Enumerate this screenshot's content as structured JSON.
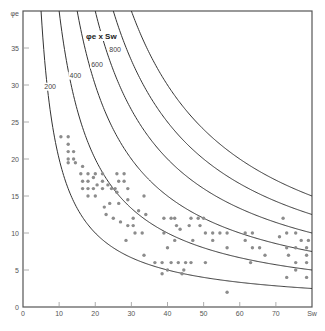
{
  "chart_data": {
    "type": "scatter",
    "title": "",
    "xlabel": "Sw",
    "ylabel": "φe",
    "xlim": [
      0,
      80
    ],
    "ylim": [
      0,
      40
    ],
    "x_ticks": [
      0,
      10,
      20,
      30,
      40,
      50,
      60,
      70
    ],
    "x_tick_labels": [
      "0",
      "10",
      "20",
      "30",
      "40",
      "50",
      "60",
      "70"
    ],
    "y_ticks": [
      0,
      5,
      10,
      15,
      20,
      25,
      30,
      35
    ],
    "y_tick_labels": [
      "0",
      "5",
      "10",
      "15",
      "20",
      "25",
      "30",
      "35"
    ],
    "grid": false,
    "curve_family_label": "φe x Sw",
    "curves": [
      {
        "name": "200",
        "const": 200,
        "label": "200",
        "label_pos": [
          7.5,
          29.5
        ]
      },
      {
        "name": "400",
        "const": 400,
        "label": "400",
        "label_pos": [
          14.5,
          31
        ]
      },
      {
        "name": "600",
        "const": 600,
        "label": "600",
        "label_pos": [
          20.5,
          32.5
        ]
      },
      {
        "name": "800",
        "const": 800,
        "label": "800",
        "label_pos": [
          25.5,
          34.5
        ]
      },
      {
        "name": "1000",
        "const": 1000,
        "label": "",
        "label_pos": null
      },
      {
        "name": "1200",
        "const": 1200,
        "label": "",
        "label_pos": null
      }
    ],
    "points": [
      [
        10.5,
        23
      ],
      [
        12.5,
        23
      ],
      [
        12.5,
        22
      ],
      [
        12.5,
        21
      ],
      [
        14,
        21
      ],
      [
        12.5,
        20
      ],
      [
        14,
        20
      ],
      [
        12.5,
        19.5
      ],
      [
        14.5,
        19.5
      ],
      [
        16.5,
        19
      ],
      [
        16,
        18
      ],
      [
        16.5,
        17
      ],
      [
        18,
        18
      ],
      [
        18,
        17
      ],
      [
        19.5,
        17.5
      ],
      [
        16.5,
        16
      ],
      [
        18,
        16
      ],
      [
        19.5,
        16
      ],
      [
        18,
        15
      ],
      [
        20,
        15
      ],
      [
        20,
        18
      ],
      [
        22,
        18
      ],
      [
        22,
        17
      ],
      [
        22,
        16
      ],
      [
        20.5,
        16.5
      ],
      [
        23.5,
        16.5
      ],
      [
        24.5,
        16
      ],
      [
        25.5,
        16
      ],
      [
        26,
        18
      ],
      [
        28,
        18
      ],
      [
        26.5,
        17
      ],
      [
        28,
        17
      ],
      [
        26.5,
        14
      ],
      [
        29,
        14.5
      ],
      [
        29,
        16
      ],
      [
        26,
        15.5
      ],
      [
        24,
        14
      ],
      [
        22.5,
        13.5
      ],
      [
        23,
        12.5
      ],
      [
        25,
        12
      ],
      [
        27,
        11.5
      ],
      [
        29,
        11
      ],
      [
        30.5,
        11
      ],
      [
        31,
        10
      ],
      [
        28.5,
        9
      ],
      [
        33,
        10
      ],
      [
        30.5,
        12
      ],
      [
        32,
        13
      ],
      [
        33.5,
        15
      ],
      [
        34,
        12.5
      ],
      [
        33.5,
        7
      ],
      [
        36.5,
        6
      ],
      [
        38.5,
        6
      ],
      [
        38.5,
        4.5
      ],
      [
        40,
        5
      ],
      [
        40,
        8
      ],
      [
        39,
        10
      ],
      [
        39,
        12
      ],
      [
        41,
        12
      ],
      [
        42,
        12
      ],
      [
        42,
        9
      ],
      [
        42.5,
        11
      ],
      [
        43.5,
        10.5
      ],
      [
        41,
        6
      ],
      [
        43,
        6
      ],
      [
        45,
        6
      ],
      [
        44,
        4.5
      ],
      [
        44.5,
        5
      ],
      [
        46.5,
        6
      ],
      [
        47,
        9
      ],
      [
        46,
        11
      ],
      [
        46.5,
        12
      ],
      [
        48.5,
        12
      ],
      [
        49,
        11
      ],
      [
        50,
        12
      ],
      [
        50.5,
        10
      ],
      [
        52.5,
        10
      ],
      [
        52.5,
        9
      ],
      [
        54.5,
        10
      ],
      [
        56.5,
        8
      ],
      [
        56.5,
        10
      ],
      [
        56.5,
        2
      ],
      [
        50.5,
        6
      ],
      [
        61.5,
        10
      ],
      [
        61.5,
        9
      ],
      [
        63.5,
        10
      ],
      [
        63.5,
        8
      ],
      [
        63,
        6
      ],
      [
        65.5,
        8
      ],
      [
        67,
        7
      ],
      [
        71,
        9.5
      ],
      [
        72,
        12
      ],
      [
        73,
        10
      ],
      [
        73,
        8
      ],
      [
        73.5,
        7
      ],
      [
        75.5,
        10
      ],
      [
        75.5,
        8
      ],
      [
        75.5,
        6
      ],
      [
        75.5,
        5
      ],
      [
        73,
        4
      ],
      [
        78.5,
        8
      ],
      [
        78.5,
        7
      ],
      [
        78.5,
        6
      ],
      [
        78.5,
        4
      ],
      [
        77,
        9
      ],
      [
        79,
        9
      ]
    ],
    "colors": {
      "points": "#8c8c8c",
      "curves": "#333333",
      "axes": "#555555"
    }
  },
  "labels": {
    "y_axis": "φe",
    "x_axis": "Sw",
    "curve_family": "φe x Sw"
  }
}
